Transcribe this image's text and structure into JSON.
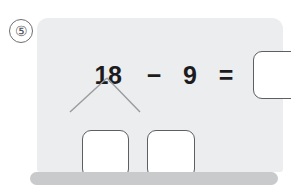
{
  "problem": {
    "number_label": "⑤",
    "equation": {
      "operand_left": "18",
      "operator": "−",
      "operand_right": "9",
      "equals": "="
    },
    "answer_box_value": "",
    "number_bond": {
      "part_left_value": "",
      "part_right_value": ""
    }
  },
  "colors": {
    "card_background": "#ecedee",
    "card_base": "#c9cacb",
    "box_border": "#5d5f63",
    "box_fill": "#ffffff",
    "text": "#1c1c1e",
    "bond_line": "#9a9b9f",
    "problem_number": "#53535a",
    "page_background": "#ffffff"
  }
}
